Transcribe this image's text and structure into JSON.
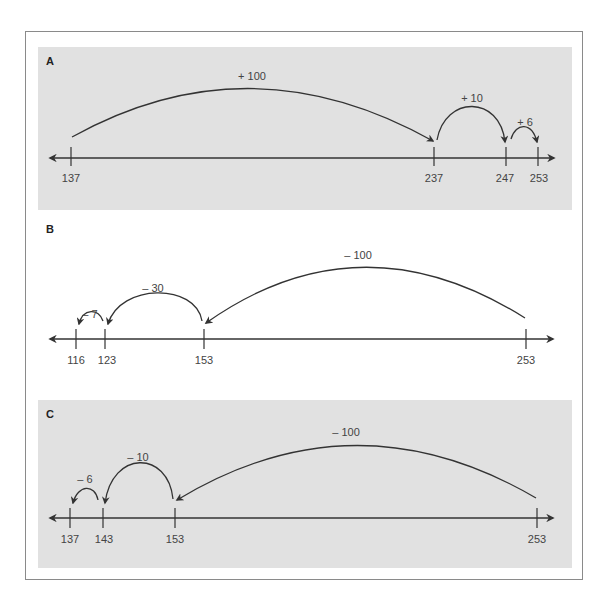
{
  "figure": {
    "panels": [
      {
        "label": "A",
        "shaded": true,
        "operation": "add",
        "ticks": [
          {
            "value": "137",
            "x": 71
          },
          {
            "value": "237",
            "x": 434
          },
          {
            "value": "247",
            "x": 506
          },
          {
            "value": "253",
            "x": 538
          }
        ],
        "jumps": [
          {
            "label": "+ 100",
            "from": "137",
            "to": "237"
          },
          {
            "label": "+ 10",
            "from": "237",
            "to": "247"
          },
          {
            "label": "+ 6",
            "from": "247",
            "to": "253"
          }
        ]
      },
      {
        "label": "B",
        "shaded": false,
        "operation": "subtract",
        "ticks": [
          {
            "value": "116",
            "x": 76
          },
          {
            "value": "123",
            "x": 105
          },
          {
            "value": "153",
            "x": 204
          },
          {
            "value": "253",
            "x": 526
          }
        ],
        "jumps": [
          {
            "label": "– 100",
            "from": "253",
            "to": "153"
          },
          {
            "label": "– 30",
            "from": "153",
            "to": "123"
          },
          {
            "label": "– 7",
            "from": "123",
            "to": "116"
          }
        ]
      },
      {
        "label": "C",
        "shaded": true,
        "operation": "subtract",
        "ticks": [
          {
            "value": "137",
            "x": 70
          },
          {
            "value": "143",
            "x": 103
          },
          {
            "value": "153",
            "x": 175
          },
          {
            "value": "253",
            "x": 537
          }
        ],
        "jumps": [
          {
            "label": "– 100",
            "from": "253",
            "to": "153"
          },
          {
            "label": "– 10",
            "from": "153",
            "to": "143"
          },
          {
            "label": "– 6",
            "from": "143",
            "to": "137"
          }
        ]
      }
    ],
    "colors": {
      "panel_fill": "#e1e1e1",
      "line": "#333333",
      "text": "#444444",
      "frame": "#8a8a8a"
    }
  }
}
